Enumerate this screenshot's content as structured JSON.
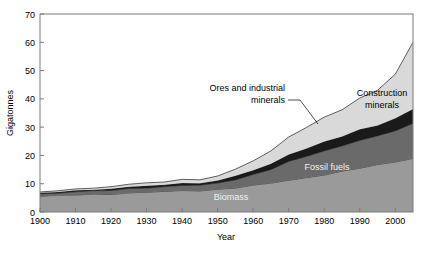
{
  "chart_data": {
    "type": "area",
    "stacked": true,
    "title": "",
    "xlabel": "Year",
    "ylabel": "Gigatonnes",
    "xlim": [
      1900,
      2005
    ],
    "ylim": [
      0,
      70
    ],
    "xticks": [
      1900,
      1910,
      1920,
      1930,
      1940,
      1950,
      1960,
      1970,
      1980,
      1990,
      2000
    ],
    "yticks": [
      0,
      10,
      20,
      30,
      40,
      50,
      60,
      70
    ],
    "grid": false,
    "legend_position": "inline-annotations",
    "x": [
      1900,
      1905,
      1910,
      1915,
      1920,
      1925,
      1930,
      1935,
      1940,
      1945,
      1950,
      1955,
      1960,
      1965,
      1970,
      1975,
      1980,
      1985,
      1990,
      1995,
      2000,
      2005
    ],
    "series": [
      {
        "name": "Biomass",
        "color": "#9a9a9a",
        "values": [
          5.5,
          5.8,
          6.0,
          6.2,
          6.4,
          6.7,
          7.0,
          7.2,
          7.5,
          7.6,
          8.0,
          8.6,
          9.3,
          10.2,
          11.2,
          12.2,
          13.2,
          14.3,
          15.5,
          16.6,
          17.8,
          19.0
        ]
      },
      {
        "name": "Fossil fuels",
        "color": "#6a6a6a",
        "values": [
          0.8,
          0.9,
          1.1,
          1.2,
          1.3,
          1.5,
          1.6,
          1.6,
          1.9,
          1.8,
          2.2,
          2.9,
          3.8,
          4.9,
          6.5,
          7.5,
          8.4,
          9.0,
          9.9,
          10.1,
          11.0,
          12.2
        ]
      },
      {
        "name": "Ores and industrial minerals",
        "color": "#1a1a1a",
        "values": [
          0.4,
          0.4,
          0.5,
          0.5,
          0.6,
          0.7,
          0.7,
          0.7,
          0.9,
          0.8,
          1.0,
          1.3,
          1.6,
          2.0,
          2.6,
          2.9,
          3.3,
          3.4,
          3.8,
          3.9,
          4.4,
          5.2
        ]
      },
      {
        "name": "Construction minerals",
        "color": "#d9d9d9",
        "values": [
          0.3,
          0.4,
          0.5,
          0.6,
          0.7,
          0.9,
          1.0,
          1.0,
          1.3,
          1.2,
          1.6,
          2.3,
          3.3,
          4.5,
          6.2,
          7.4,
          8.6,
          9.4,
          11.0,
          12.4,
          15.6,
          23.6
        ]
      }
    ],
    "annotations": [
      {
        "name": "Biomass",
        "text": "Biomass",
        "style": "light"
      },
      {
        "name": "Fossil fuels",
        "text": "Fossil fuels",
        "style": "light"
      },
      {
        "name": "Ores and industrial minerals",
        "line1": "Ores and industrial",
        "line2": "minerals",
        "style": "dark"
      },
      {
        "name": "Construction minerals",
        "line1": "Construction",
        "line2": "minerals",
        "style": "dark"
      }
    ]
  },
  "axis": {
    "y_title": "Gigatonnes",
    "x_title": "Year",
    "yticks": [
      "70",
      "60",
      "50",
      "40",
      "30",
      "20",
      "10",
      "0"
    ],
    "xticks": [
      "1900",
      "1910",
      "1920",
      "1930",
      "1940",
      "1950",
      "1960",
      "1970",
      "1980",
      "1990",
      "2000"
    ]
  },
  "labels": {
    "biomass": "Biomass",
    "fossil_fuels": "Fossil fuels",
    "ores_line1": "Ores and industrial",
    "ores_line2": "minerals",
    "construction_line1": "Construction",
    "construction_line2": "minerals"
  },
  "colors": {
    "biomass": "#9a9a9a",
    "fossil_fuels": "#6a6a6a",
    "ores": "#1a1a1a",
    "construction": "#d9d9d9",
    "frame": "#7a7a7a",
    "background": "#ffffff"
  }
}
